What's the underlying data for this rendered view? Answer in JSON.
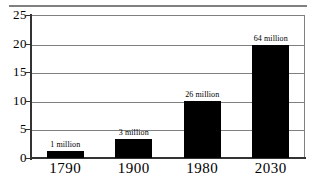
{
  "chart_data": {
    "type": "bar",
    "title": "",
    "subtitle": "",
    "xlabel": "",
    "ylabel": "",
    "categories": [
      "1790",
      "1900",
      "1980",
      "2030"
    ],
    "values": [
      1.3,
      3.4,
      10.0,
      19.7
    ],
    "data_labels": [
      "1 million",
      "3 million",
      "26 million",
      "64 million"
    ],
    "ylim": [
      0,
      25
    ],
    "yticks": [
      0,
      5,
      10,
      15,
      20,
      25
    ],
    "ytick_labels": [
      "0",
      "5",
      "10",
      "15",
      "20",
      "25"
    ],
    "grid": true,
    "grid_axis": "y",
    "legend": "none",
    "bar_color": "#000000",
    "grid_color": "#808080",
    "axis_color": "#333333",
    "background_color": "#ffffff"
  },
  "figure": {
    "top_rule_color": "#808080"
  }
}
